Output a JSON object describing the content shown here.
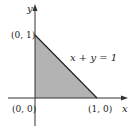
{
  "diagram": {
    "axes": {
      "x_label": "x",
      "y_label": "y"
    },
    "points": [
      {
        "label": "(0, 0)",
        "coords": [
          0,
          0
        ]
      },
      {
        "label": "(1, 0)",
        "coords": [
          1,
          0
        ]
      },
      {
        "label": "(0, 1)",
        "coords": [
          0,
          1
        ]
      }
    ],
    "line_equation": "x + y = 1",
    "region": {
      "shape": "triangle",
      "vertices": [
        [
          0,
          0
        ],
        [
          1,
          0
        ],
        [
          0,
          1
        ]
      ],
      "fill": "#b3b3b3"
    },
    "colors": {
      "axis": "#333333",
      "line": "#222222",
      "shade": "#b3b3b3"
    }
  }
}
